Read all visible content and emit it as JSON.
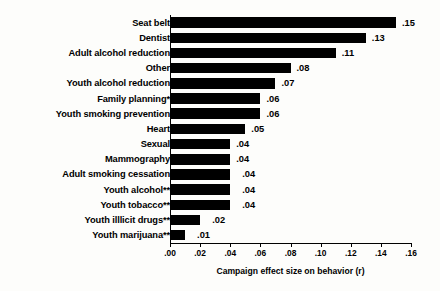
{
  "chart_data": {
    "type": "bar",
    "orientation": "horizontal",
    "title": "",
    "xlabel": "Campaign effect size on behavior (r)",
    "ylabel": "",
    "xlim": [
      0.0,
      0.16
    ],
    "xticks": [
      ".00",
      ".02",
      ".04",
      ".06",
      ".08",
      ".10",
      ".12",
      ".14",
      ".16"
    ],
    "xtick_values": [
      0.0,
      0.02,
      0.04,
      0.06,
      0.08,
      0.1,
      0.12,
      0.14,
      0.16
    ],
    "grid": false,
    "legend": "none",
    "bar_color": "#000000",
    "categories": [
      "Seat belt",
      "Dentist",
      "Adult alcohol reduction",
      "Other",
      "Youth alcohol reduction",
      "Family planning*",
      "Youth smoking prevention",
      "Heart",
      "Sexual",
      "Mammography",
      "Adult smoking cessation",
      "Youth alcohol**",
      "Youth tobacco**",
      "Youth illlicit drugs**",
      "Youth marijuana**"
    ],
    "values": [
      0.15,
      0.13,
      0.11,
      0.08,
      0.07,
      0.06,
      0.06,
      0.05,
      0.04,
      0.04,
      0.04,
      0.04,
      0.04,
      0.02,
      0.01
    ],
    "value_labels": [
      ".15",
      ".13",
      ".11",
      ".08",
      ".07",
      ".06",
      ".06",
      ".05",
      ".04",
      ".04",
      ".04",
      ".04",
      ".04",
      ".02",
      ".01"
    ],
    "label_gap_px": [
      6,
      6,
      6,
      6,
      6,
      6,
      6,
      6,
      6,
      6,
      12,
      12,
      12,
      12,
      12
    ]
  }
}
